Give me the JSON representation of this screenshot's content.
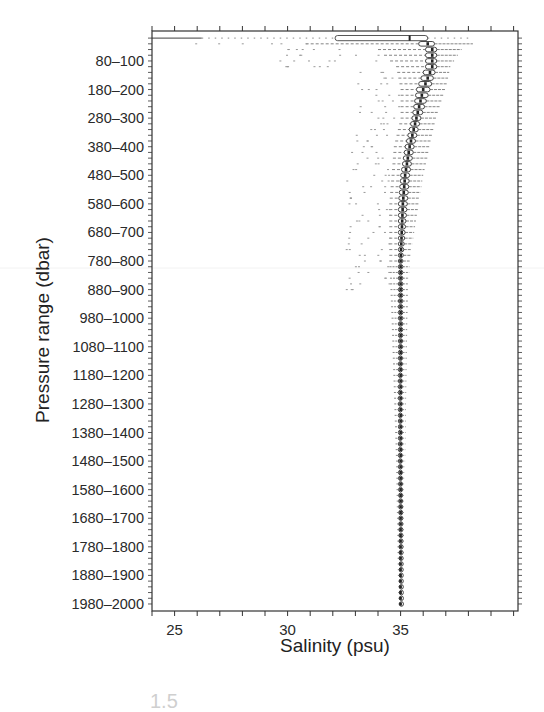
{
  "chart_data": {
    "type": "boxplot",
    "title": "",
    "xlabel": "Salinity (psu)",
    "ylabel": "Pressure range (dbar)",
    "xlim": [
      24,
      40.2
    ],
    "x_ticks": [
      25,
      30,
      35
    ],
    "x_minor_step": 1,
    "y_bin_size_dbar": 20,
    "y_bins": 100,
    "y_tick_labels": [
      "80–100",
      "180–200",
      "280–300",
      "380–400",
      "480–500",
      "580–600",
      "680–700",
      "780–800",
      "880–900",
      "980–1000",
      "1080–1100",
      "1180–1200",
      "1280–1300",
      "1380–1400",
      "1480–1500",
      "1580–1600",
      "1680–1700",
      "1780–1800",
      "1880–1900",
      "1980–2000"
    ],
    "grid": false,
    "legend": null,
    "series_summary": [
      {
        "pressure": "0–20",
        "q1": 32.1,
        "median": 35.4,
        "q3": 36.2,
        "whisker_low": 24.0,
        "whisker_high": 36.3,
        "outliers_low_to": 24.0,
        "outliers_high_to": 38.0
      },
      {
        "pressure": "20–40",
        "q1": 35.8,
        "median": 36.2,
        "q3": 36.5,
        "whisker_low": 30.8,
        "whisker_high": 38.2
      },
      {
        "pressure": "40–60",
        "q1": 36.1,
        "median": 36.4,
        "q3": 36.6,
        "whisker_low": 34.0,
        "whisker_high": 37.7
      },
      {
        "pressure": "100–120",
        "q1": 36.1,
        "median": 36.4,
        "q3": 36.6,
        "whisker_low": 34.8,
        "whisker_high": 37.2
      },
      {
        "pressure": "180–200",
        "q1": 35.7,
        "median": 36.0,
        "q3": 36.3,
        "whisker_low": 35.0,
        "whisker_high": 37.0
      },
      {
        "pressure": "280–300",
        "q1": 35.5,
        "median": 35.7,
        "q3": 35.9,
        "whisker_low": 35.0,
        "whisker_high": 36.6
      },
      {
        "pressure": "380–400",
        "q1": 35.2,
        "median": 35.4,
        "q3": 35.6,
        "whisker_low": 34.7,
        "whisker_high": 36.3
      },
      {
        "pressure": "480–500",
        "q1": 35.0,
        "median": 35.2,
        "q3": 35.4,
        "whisker_low": 34.6,
        "whisker_high": 36.0
      },
      {
        "pressure": "580–600",
        "q1": 34.9,
        "median": 35.1,
        "q3": 35.3,
        "whisker_low": 34.5,
        "whisker_high": 35.8
      },
      {
        "pressure": "780–800",
        "q1": 34.9,
        "median": 35.0,
        "q3": 35.1,
        "whisker_low": 34.5,
        "whisker_high": 35.4
      },
      {
        "pressure": "980–1000",
        "q1": 34.9,
        "median": 35.0,
        "q3": 35.1,
        "whisker_low": 34.6,
        "whisker_high": 35.3
      },
      {
        "pressure": "1480–1500",
        "q1": 34.9,
        "median": 35.0,
        "q3": 35.05,
        "whisker_low": 34.8,
        "whisker_high": 35.2
      },
      {
        "pressure": "1980–2000",
        "q1": 34.95,
        "median": 35.0,
        "q3": 35.05,
        "whisker_low": 34.9,
        "whisker_high": 35.1
      }
    ]
  },
  "figure": {
    "caption_fragment": "1.5"
  }
}
